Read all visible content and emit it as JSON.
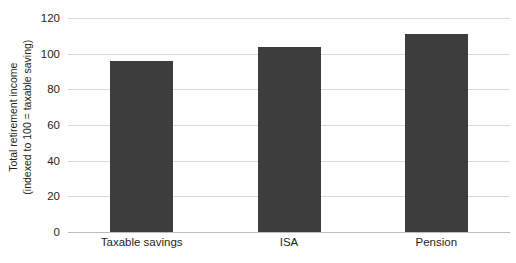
{
  "chart_data": {
    "type": "bar",
    "title": "",
    "subtitle": "",
    "xlabel": "",
    "ylabel_lines": [
      "Total retirement income",
      "(indexed to 100 = taxable saving)"
    ],
    "ylabel": "Total retirement income (indexed to 100 = taxable saving)",
    "categories": [
      "Taxable savings",
      "ISA",
      "Pension"
    ],
    "values": [
      96,
      104,
      111
    ],
    "ylim": [
      0,
      120
    ],
    "yticks": [
      0,
      20,
      40,
      60,
      80,
      100,
      120
    ],
    "ytick_labels": [
      "0",
      "20",
      "40",
      "60",
      "80",
      "100",
      "120"
    ],
    "grid": true,
    "grid_axis": "y",
    "legend": false,
    "legend_position": "none",
    "bar_color": "#3d3d3d",
    "gridline_color": "#d6d8da",
    "axis_color": "#b9bcbf",
    "text_color": "#231f20",
    "background_color": "#ffffff"
  }
}
